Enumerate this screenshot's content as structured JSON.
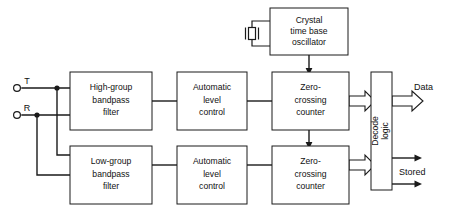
{
  "diagram": {
    "terminals": [
      {
        "label": "T",
        "name": "terminal-t"
      },
      {
        "label": "R",
        "name": "terminal-r"
      }
    ],
    "blocks": {
      "oscillator": {
        "line1": "Crystal",
        "line2": "time base",
        "line3": "oscillator"
      },
      "high_filter": {
        "line1": "High-group",
        "line2": "bandpass",
        "line3": "filter"
      },
      "low_filter": {
        "line1": "Low-group",
        "line2": "bandpass",
        "line3": "filter"
      },
      "alc_top": {
        "line1": "Automatic",
        "line2": "level",
        "line3": "control"
      },
      "alc_bottom": {
        "line1": "Automatic",
        "line2": "level",
        "line3": "control"
      },
      "counter_top": {
        "line1": "Zero-",
        "line2": "crossing",
        "line3": "counter"
      },
      "counter_bottom": {
        "line1": "Zero-",
        "line2": "crossing",
        "line3": "counter"
      },
      "decode": {
        "line1": "Decode",
        "line2": "logic"
      }
    },
    "outputs": [
      {
        "label": "Data",
        "name": "output-data"
      },
      {
        "label": "Stored",
        "name": "output-stored"
      }
    ],
    "colors": {
      "line": "#1a1a1a",
      "background": "#ffffff",
      "text": "#111111"
    }
  }
}
